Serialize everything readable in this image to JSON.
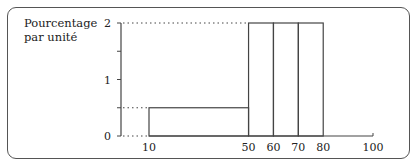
{
  "chart_data": {
    "type": "bar",
    "subtype": "histogram",
    "title": "",
    "ylabel_lines": [
      "Pourcentage",
      "par unité"
    ],
    "xlabel": "",
    "bins": [
      {
        "from": 10,
        "to": 50,
        "density": 0.5
      },
      {
        "from": 50,
        "to": 60,
        "density": 2
      },
      {
        "from": 60,
        "to": 70,
        "density": 2
      },
      {
        "from": 70,
        "to": 80,
        "density": 2
      }
    ],
    "xlim": [
      10,
      100
    ],
    "ylim": [
      0,
      2
    ],
    "x_ticks": [
      10,
      50,
      60,
      70,
      80,
      100
    ],
    "x_tick_labels": [
      "10",
      "50",
      "60",
      "70",
      "80",
      "100"
    ],
    "y_ticks": [
      0,
      0.5,
      1,
      1.5,
      2
    ],
    "y_tick_labels": [
      {
        "value": 0,
        "label": "0"
      },
      {
        "value": 1,
        "label": "1"
      },
      {
        "value": 2,
        "label": "2"
      }
    ],
    "reference_lines": [
      {
        "y": 2,
        "style": "dotted"
      },
      {
        "y": 0.5,
        "style": "dotted"
      },
      {
        "y": 0,
        "style": "dotted"
      }
    ],
    "grid": false,
    "legend": "none",
    "colors": {
      "stroke": "#444444",
      "text": "#222222"
    }
  }
}
